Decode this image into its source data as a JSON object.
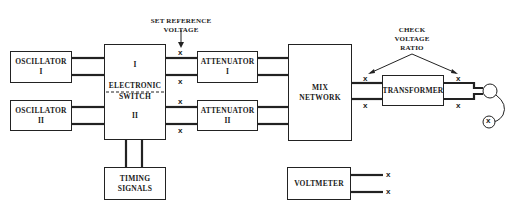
{
  "diagram": {
    "blocks": {
      "oscillator_1": {
        "line1": "OSCILLATOR",
        "line2": "I"
      },
      "oscillator_2": {
        "line1": "OSCILLATOR",
        "line2": "II"
      },
      "electronic_switch": {
        "top": "I",
        "label1": "ELECTRONIC",
        "label2": "SWITCH",
        "bottom": "II"
      },
      "attenuator_1": {
        "line1": "ATTENUATOR",
        "line2": "I"
      },
      "attenuator_2": {
        "line1": "ATTENUATOR",
        "line2": "II"
      },
      "mix_network": {
        "line1": "MIX",
        "line2": "NETWORK"
      },
      "transformer": {
        "line1": "TRANSFORMER"
      },
      "timing_signals": {
        "line1": "TIMING",
        "line2": "SIGNALS"
      },
      "voltmeter": {
        "line1": "VOLTMETER"
      }
    },
    "annotations": {
      "set_reference": {
        "line1": "SET REFERENCE",
        "line2": "VOLTAGE"
      },
      "check_ratio": {
        "line1": "CHECK",
        "line2": "VOLTAGE",
        "line3": "RATIO"
      }
    },
    "test_point_mark": "x",
    "colors": {
      "line": "#222222",
      "background": "#ffffff"
    }
  }
}
